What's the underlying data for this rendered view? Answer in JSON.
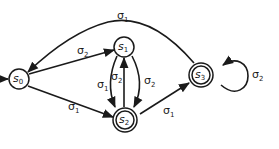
{
  "diagram": {
    "type": "finite-state-automaton",
    "initial_state": "s0",
    "states": [
      {
        "id": "s0",
        "base": "s",
        "sub": "0",
        "accepting": false
      },
      {
        "id": "s1",
        "base": "s",
        "sub": "1",
        "accepting": false
      },
      {
        "id": "s2",
        "base": "s",
        "sub": "2",
        "accepting": true
      },
      {
        "id": "s3",
        "base": "s",
        "sub": "3",
        "accepting": true
      }
    ],
    "transitions": [
      {
        "from": "s0",
        "to": "s1",
        "label": "σ",
        "sub": "2"
      },
      {
        "from": "s0",
        "to": "s2",
        "label": "σ",
        "sub": "1"
      },
      {
        "from": "s1",
        "to": "s2",
        "label": "σ",
        "sub": "1"
      },
      {
        "from": "s1",
        "to": "s2",
        "label": "σ",
        "sub": "2"
      },
      {
        "from": "s2",
        "to": "s1",
        "label": "σ",
        "sub": "2"
      },
      {
        "from": "s2",
        "to": "s3",
        "label": "σ",
        "sub": "1"
      },
      {
        "from": "s3",
        "to": "s0",
        "label": "σ",
        "sub": "1"
      },
      {
        "from": "s3",
        "to": "s3",
        "label": "σ",
        "sub": "2"
      }
    ]
  }
}
